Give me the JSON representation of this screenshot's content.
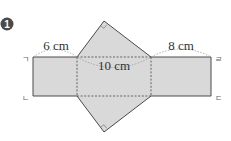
{
  "problem": {
    "number": "1",
    "marker_color": "#4a4a4a"
  },
  "net": {
    "description": "Net of a triangular prism: three rectangles in a row with right isosceles triangles above and below the middle rectangle",
    "face_fill": "#d9d9d9",
    "line_color": "#4a4a4a",
    "dimensions": {
      "left_width": "6 cm",
      "middle_width": "10 cm",
      "right_width": "8 cm"
    },
    "corner_labels": {
      "top_left": "ㄱ",
      "bottom_left": "ㄴ",
      "bottom_right": "ㄷ",
      "top_right": "ㄹ"
    }
  }
}
